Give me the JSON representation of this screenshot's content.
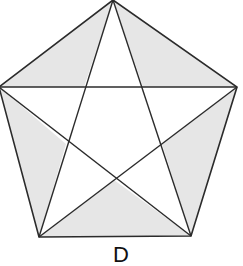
{
  "diagram": {
    "type": "pentagon-with-pentagram",
    "vertices": {
      "top": [
        113,
        0
      ],
      "right": [
        237,
        87
      ],
      "bottom_right": [
        191,
        236
      ],
      "bottom_left": [
        39,
        237
      ],
      "left": [
        -1,
        87
      ]
    },
    "colors": {
      "stroke": "#2b2b2b",
      "shaded_fill": "#e6e6e6",
      "unshaded_fill": "#ffffff"
    },
    "caption": "D"
  }
}
